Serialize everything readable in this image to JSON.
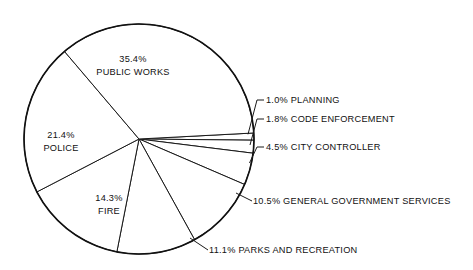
{
  "chart_data": {
    "type": "pie",
    "title": "",
    "subtitle": "",
    "xlabel": "",
    "ylabel": "",
    "legend_position": "none",
    "grid": false,
    "labels_are_uppercase": true,
    "total_percent": 100.0,
    "categories": [
      "PUBLIC WORKS",
      "POLICE",
      "FIRE",
      "PARKS AND RECREATION",
      "GENERAL GOVERNMENT SERVICES",
      "CITY CONTROLLER",
      "CODE ENFORCEMENT",
      "PLANNING"
    ],
    "values": [
      35.4,
      21.4,
      14.3,
      11.1,
      10.5,
      4.5,
      1.8,
      1.0
    ],
    "slices": [
      {
        "id": "planning",
        "name": "PLANNING",
        "percent": 1.0,
        "percent_text": "1.0%",
        "label": "1.0% PLANNING",
        "label_placement": "outside",
        "start_angle_deg": -3.0,
        "end_angle_deg": 0.6
      },
      {
        "id": "code-enforcement",
        "name": "CODE ENFORCEMENT",
        "percent": 1.8,
        "percent_text": "1.8%",
        "label": "1.8% CODE ENFORCEMENT",
        "label_placement": "outside",
        "start_angle_deg": 0.6,
        "end_angle_deg": 7.1
      },
      {
        "id": "city-controller",
        "name": "CITY CONTROLLER",
        "percent": 4.5,
        "percent_text": "4.5%",
        "label": "4.5% CITY CONTROLLER",
        "label_placement": "outside",
        "start_angle_deg": 7.1,
        "end_angle_deg": 23.3
      },
      {
        "id": "general-government-services",
        "name": "GENERAL GOVERNMENT SERVICES",
        "percent": 10.5,
        "percent_text": "10.5%",
        "label": "10.5% GENERAL GOVERNMENT SERVICES",
        "label_placement": "outside",
        "start_angle_deg": 23.3,
        "end_angle_deg": 61.1
      },
      {
        "id": "parks-and-recreation",
        "name": "PARKS AND RECREATION",
        "percent": 11.1,
        "percent_text": "11.1%",
        "label": "11.1% PARKS AND RECREATION",
        "label_placement": "outside",
        "start_angle_deg": 61.1,
        "end_angle_deg": 101.1
      },
      {
        "id": "fire",
        "name": "FIRE",
        "percent": 14.3,
        "percent_text": "14.3%",
        "label_line_1": "14.3%",
        "label_line_2": "FIRE",
        "label_placement": "inside",
        "start_angle_deg": 101.1,
        "end_angle_deg": 152.6
      },
      {
        "id": "police",
        "name": "POLICE",
        "percent": 21.4,
        "percent_text": "21.4%",
        "label_line_1": "21.4%",
        "label_line_2": "POLICE",
        "label_placement": "inside",
        "start_angle_deg": 152.6,
        "end_angle_deg": 229.6
      },
      {
        "id": "public-works",
        "name": "PUBLIC WORKS",
        "percent": 35.4,
        "percent_text": "35.4%",
        "label_line_1": "35.4%",
        "label_line_2": "PUBLIC WORKS",
        "label_placement": "inside",
        "start_angle_deg": 229.6,
        "end_angle_deg": 357.0
      }
    ],
    "colors": {
      "slice_fill": "#ffffff",
      "outline": "#111111",
      "text": "#111111",
      "background": "#ffffff"
    }
  }
}
